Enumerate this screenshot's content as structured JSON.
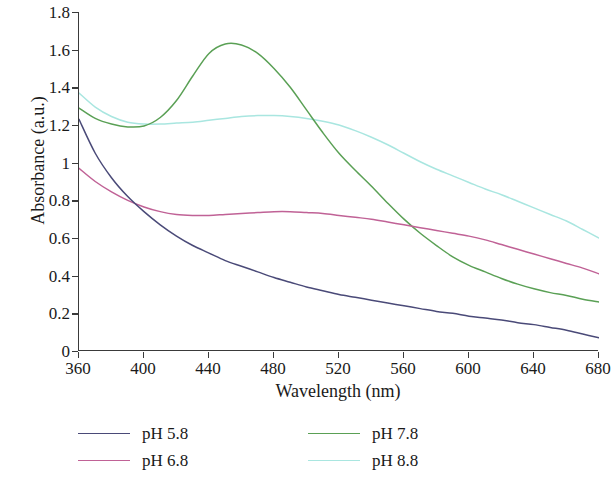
{
  "chart_data": {
    "type": "line",
    "title": "",
    "xlabel": "Wavelength (nm)",
    "ylabel": "Absorbance (a.u.)",
    "xlim": [
      360,
      680
    ],
    "ylim": [
      0,
      1.8
    ],
    "xticks": [
      360,
      400,
      440,
      480,
      520,
      560,
      600,
      640,
      680
    ],
    "ytick_labels": [
      "0",
      "0.2",
      "0.4",
      "0.6",
      "0.8",
      "1",
      "1.2",
      "1.4",
      "1.6",
      "1.8"
    ],
    "yticks": [
      0,
      0.2,
      0.4,
      0.6,
      0.8,
      1.0,
      1.2,
      1.4,
      1.6,
      1.8
    ],
    "grid": false,
    "legend_position": "below-plot",
    "x": [
      360,
      370,
      380,
      390,
      400,
      410,
      420,
      430,
      440,
      450,
      460,
      470,
      480,
      490,
      500,
      510,
      520,
      530,
      540,
      550,
      560,
      570,
      580,
      590,
      600,
      610,
      620,
      630,
      640,
      650,
      660,
      670,
      680
    ],
    "series": [
      {
        "name": "pH 5.8",
        "color": "#4a4a78",
        "values": [
          1.23,
          1.05,
          0.92,
          0.82,
          0.74,
          0.67,
          0.61,
          0.56,
          0.52,
          0.48,
          0.45,
          0.42,
          0.39,
          0.365,
          0.34,
          0.32,
          0.3,
          0.285,
          0.27,
          0.255,
          0.24,
          0.225,
          0.21,
          0.2,
          0.185,
          0.175,
          0.165,
          0.15,
          0.14,
          0.125,
          0.11,
          0.09,
          0.07
        ]
      },
      {
        "name": "pH 6.8",
        "color": "#c06296",
        "values": [
          0.97,
          0.9,
          0.845,
          0.8,
          0.765,
          0.74,
          0.725,
          0.72,
          0.72,
          0.725,
          0.73,
          0.735,
          0.74,
          0.74,
          0.735,
          0.73,
          0.72,
          0.71,
          0.7,
          0.685,
          0.67,
          0.655,
          0.64,
          0.625,
          0.61,
          0.59,
          0.565,
          0.54,
          0.515,
          0.49,
          0.465,
          0.44,
          0.41
        ]
      },
      {
        "name": "pH 7.8",
        "color": "#5aa055",
        "values": [
          1.29,
          1.235,
          1.205,
          1.19,
          1.195,
          1.24,
          1.33,
          1.46,
          1.58,
          1.63,
          1.625,
          1.58,
          1.5,
          1.4,
          1.28,
          1.16,
          1.05,
          0.96,
          0.875,
          0.785,
          0.7,
          0.625,
          0.56,
          0.5,
          0.455,
          0.42,
          0.385,
          0.355,
          0.33,
          0.31,
          0.295,
          0.275,
          0.26
        ]
      },
      {
        "name": "pH 8.8",
        "color": "#a9e6e0",
        "values": [
          1.37,
          1.295,
          1.245,
          1.215,
          1.205,
          1.205,
          1.21,
          1.215,
          1.225,
          1.235,
          1.245,
          1.25,
          1.25,
          1.245,
          1.235,
          1.22,
          1.2,
          1.17,
          1.135,
          1.095,
          1.05,
          1.005,
          0.965,
          0.93,
          0.895,
          0.86,
          0.83,
          0.795,
          0.76,
          0.725,
          0.69,
          0.645,
          0.6
        ]
      }
    ]
  },
  "legend": {
    "items": [
      {
        "label": "pH 5.8",
        "color": "#4a4a78"
      },
      {
        "label": "pH 6.8",
        "color": "#c06296"
      },
      {
        "label": "pH 7.8",
        "color": "#5aa055"
      },
      {
        "label": "pH 8.8",
        "color": "#a9e6e0"
      }
    ]
  },
  "axis": {
    "x_title": "Wavelength (nm)",
    "y_title": "Absorbance (a.u.)"
  }
}
